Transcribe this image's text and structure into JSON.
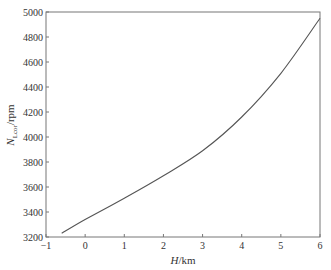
{
  "chart_data": {
    "type": "line",
    "title": "",
    "xlabel": "H/km",
    "xlabel_var": "H",
    "xlabel_unit": "/km",
    "ylabel": "N_Lcor/rpm",
    "ylabel_var": "N",
    "ylabel_sub": "Lcor",
    "ylabel_unit": "/rpm",
    "xlim": [
      -1,
      6
    ],
    "ylim": [
      3200,
      5000
    ],
    "xticks": [
      -1,
      0,
      1,
      2,
      3,
      4,
      5,
      6
    ],
    "xtick_labels": [
      "−1",
      "0",
      "1",
      "2",
      "3",
      "4",
      "5",
      "6"
    ],
    "yticks": [
      3200,
      3400,
      3600,
      3800,
      4000,
      4200,
      4400,
      4600,
      4800,
      5000
    ],
    "ytick_labels": [
      "3200",
      "3400",
      "3600",
      "3800",
      "4000",
      "4200",
      "4400",
      "4600",
      "4800",
      "5000"
    ],
    "grid": false,
    "legend": null,
    "series": [
      {
        "name": "N_Lcor",
        "color": "#555555",
        "x": [
          -0.6,
          0,
          1,
          2,
          3,
          4,
          5,
          6
        ],
        "y": [
          3230,
          3340,
          3510,
          3690,
          3890,
          4160,
          4510,
          4950
        ]
      }
    ]
  }
}
